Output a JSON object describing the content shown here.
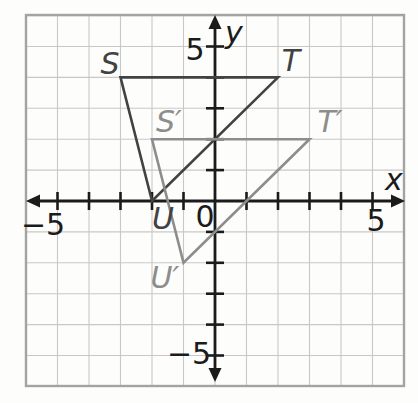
{
  "plane": {
    "x_axis_label": "x",
    "y_axis_label": "y",
    "origin_label": "0",
    "x_tick_labels": [
      {
        "value": -5,
        "text": "−5"
      },
      {
        "value": 5,
        "text": "5"
      }
    ],
    "y_tick_labels": [
      {
        "value": 5,
        "text": "5"
      },
      {
        "value": -5,
        "text": "−5"
      }
    ],
    "grid_range": {
      "xmin": -6,
      "xmax": 6,
      "ymin": -6,
      "ymax": 6
    },
    "tick_range": {
      "min": -5,
      "max": 5
    },
    "grid_step": 1,
    "colors": {
      "grid": "#c8c8c8",
      "frame": "#a3a3a3",
      "axis": "#1b1b1b",
      "background": "#fdfdfc"
    }
  },
  "triangles": [
    {
      "name": "triangle STU",
      "role": "preimage",
      "color": "#424242",
      "vertices": [
        {
          "label": "S",
          "x": -3,
          "y": 4
        },
        {
          "label": "T",
          "x": 2,
          "y": 4
        },
        {
          "label": "U",
          "x": -2,
          "y": 0
        }
      ]
    },
    {
      "name": "triangle S′T′U′",
      "role": "translated image",
      "color": "#8d8d8d",
      "vertices": [
        {
          "label": "S′",
          "x": -2,
          "y": 2
        },
        {
          "label": "T′",
          "x": 3,
          "y": 2
        },
        {
          "label": "U′",
          "x": -1,
          "y": -2
        }
      ]
    }
  ]
}
